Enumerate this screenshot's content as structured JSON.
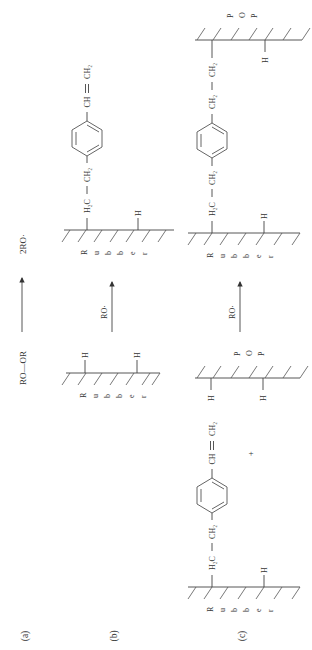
{
  "figure": {
    "orientation": "rotated 90 degrees counter-clockwise (text reads bottom-to-top)",
    "colors": {
      "line": "#444444",
      "text": "#333333",
      "background": "#ffffff"
    },
    "panels": [
      {
        "id": "a",
        "label": "(a)"
      },
      {
        "id": "b",
        "label": "(b)"
      },
      {
        "id": "c",
        "label": "(c)"
      }
    ]
  },
  "panel_a": {
    "reactant": "RO—OR",
    "product": "2RO·"
  },
  "panel_b": {
    "reagent": "RO·",
    "reactant_substrate": "Rubber",
    "reactant_H1": "H",
    "reactant_H2": "H",
    "product_substrate": "Rubber",
    "product_H": "H",
    "product_graft": {
      "h2c": "H₂C",
      "ch2": "CH₂",
      "vinyl_ch": "CH",
      "vinyl_ch2": "CH₂",
      "full": "H₂C—CH₂—C₆H₄—CH=CH₂"
    }
  },
  "panel_c": {
    "reagent": "RO·",
    "plus": "+",
    "reactant_substrate": "Rubber",
    "reactant_H": "H",
    "reactant_graft": {
      "h2c": "H₂C",
      "ch2": "CH₂",
      "vinyl_ch": "CH",
      "vinyl_ch2": "CH₂"
    },
    "second_substrate": "POP",
    "second_H1": "H",
    "second_H2": "H",
    "product_substrate_1": "Rubber",
    "product_substrate_2": "POP",
    "product_H1": "H",
    "product_H2": "H",
    "product_bridge": {
      "h2c": "H₂C",
      "ch2_a": "CH₂",
      "ch2_b": "CH₂",
      "ch2_c": "CH₂"
    }
  }
}
